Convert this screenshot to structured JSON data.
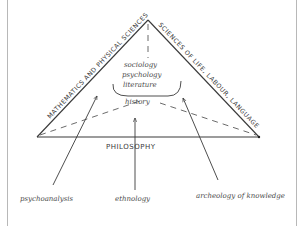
{
  "diagram": {
    "edges": {
      "left": "MATHEMATICS AND PHYSICAL SCIENCES",
      "right": "SCIENCES OF LIFE, LABOUR, LANGUAGE",
      "base": "PHILOSOPHY"
    },
    "center": {
      "items": [
        "sociology",
        "psychology",
        "literature"
      ],
      "below_bracket": "history"
    },
    "arrows": [
      {
        "label": "psychoanalysis"
      },
      {
        "label": "ethnology"
      },
      {
        "label": "archeology of knowledge"
      }
    ],
    "colors": {
      "ink": "#3a3a3a",
      "border": "#b8b8b8",
      "background": "#ffffff"
    }
  }
}
